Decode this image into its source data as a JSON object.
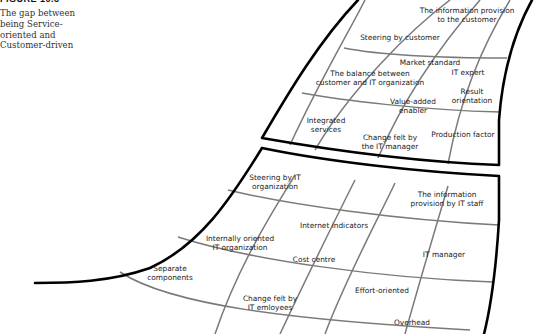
{
  "figure": {
    "label": "FIGURE 10.3",
    "caption": "The gap between being Service-oriented and Customer-driven"
  },
  "upper_shape": {
    "name": "Customer-driven",
    "labels": [
      {
        "id": "info-customer",
        "line1": "The information provision",
        "line2": "to the customer"
      },
      {
        "id": "steering-customer",
        "line1": "Steering by customer",
        "line2": ""
      },
      {
        "id": "market-standard",
        "line1": "Market standard",
        "line2": ""
      },
      {
        "id": "balance",
        "line1": "The balance between",
        "line2": "customer and IT organization"
      },
      {
        "id": "it-expert",
        "line1": "IT expert",
        "line2": ""
      },
      {
        "id": "result-orientation",
        "line1": "Result",
        "line2": "orientation"
      },
      {
        "id": "value-added",
        "line1": "Value-added",
        "line2": "enabler"
      },
      {
        "id": "integrated-services",
        "line1": "Integrated",
        "line2": "services"
      },
      {
        "id": "change-it-manager",
        "line1": "Change felt by",
        "line2": "the IT manager"
      },
      {
        "id": "production-factor",
        "line1": "Production factor",
        "line2": ""
      }
    ]
  },
  "lower_shape": {
    "name": "Service-oriented",
    "labels": [
      {
        "id": "steering-it",
        "line1": "Steering by IT",
        "line2": "organization"
      },
      {
        "id": "info-it-staff",
        "line1": "The information",
        "line2": "provision by IT staff"
      },
      {
        "id": "internet-indicators",
        "line1": "Internet indicators",
        "line2": ""
      },
      {
        "id": "internally-oriented",
        "line1": "Internally oriented",
        "line2": "IT organization"
      },
      {
        "id": "it-manager",
        "line1": "IT manager",
        "line2": ""
      },
      {
        "id": "cost-centre",
        "line1": "Cost centre",
        "line2": ""
      },
      {
        "id": "separate-components",
        "line1": "Separate",
        "line2": "components"
      },
      {
        "id": "effort-oriented",
        "line1": "Effort-oriented",
        "line2": ""
      },
      {
        "id": "change-it-employees",
        "line1": "Change felt by",
        "line2": "IT emloyees"
      },
      {
        "id": "overhead",
        "line1": "Overhead",
        "line2": ""
      }
    ]
  },
  "colors": {
    "outline": "#000000",
    "grid": "#7a7a7a",
    "text": "#222222"
  }
}
